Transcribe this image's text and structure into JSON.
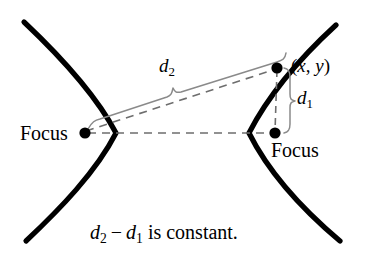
{
  "figure": {
    "name": "hyperbola-definition-diagram",
    "type": "geometry-diagram",
    "background_color": "#ffffff",
    "stroke_color": "#000000",
    "brace_color": "#8a8a8a",
    "dash_color": "#6e6e6e",
    "width": 366,
    "height": 266
  },
  "labels": {
    "focus_left": "Focus",
    "focus_right": "Focus",
    "point": {
      "open_paren": "(",
      "x": "x",
      "comma": ", ",
      "y": "y",
      "close_paren": ")"
    },
    "d2": {
      "letter": "d",
      "sub": "2"
    },
    "d1": {
      "letter": "d",
      "sub": "1"
    },
    "caption": {
      "d2_letter": "d",
      "d2_sub": "2",
      "minus": "−",
      "d1_letter": "d",
      "d1_sub": "1",
      "tail": "is constant."
    }
  },
  "geometry": {
    "focus_left": {
      "x": 85,
      "y": 133
    },
    "focus_right": {
      "x": 275,
      "y": 133
    },
    "point_xy": {
      "x": 277,
      "y": 68
    },
    "left_branch_vertex": {
      "x": 116,
      "y": 133
    },
    "right_branch_vertex": {
      "x": 249,
      "y": 133
    },
    "axis_dash_y": 133,
    "d1_brace_x": 289,
    "d2_brace_label_anchor": {
      "x": 173,
      "y": 80
    }
  },
  "icons": {
    "focus_left_dot": "filled-dot",
    "focus_right_dot": "filled-dot",
    "point_dot": "filled-dot"
  }
}
